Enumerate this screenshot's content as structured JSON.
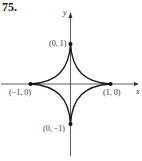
{
  "problem_number": "75.",
  "axes": {
    "x_label": "x",
    "y_label": "y"
  },
  "points": [
    {
      "label": "(0, 1)",
      "x": 0,
      "y": 1
    },
    {
      "label": "(−1, 0)",
      "x": -1,
      "y": 0
    },
    {
      "label": "(1, 0)",
      "x": 1,
      "y": 0
    },
    {
      "label": "(0, −1)",
      "x": 0,
      "y": -1
    }
  ],
  "curve": {
    "name": "astroid",
    "equation": "x^(2/3) + y^(2/3) = 1",
    "color": "#1a1a1a"
  }
}
